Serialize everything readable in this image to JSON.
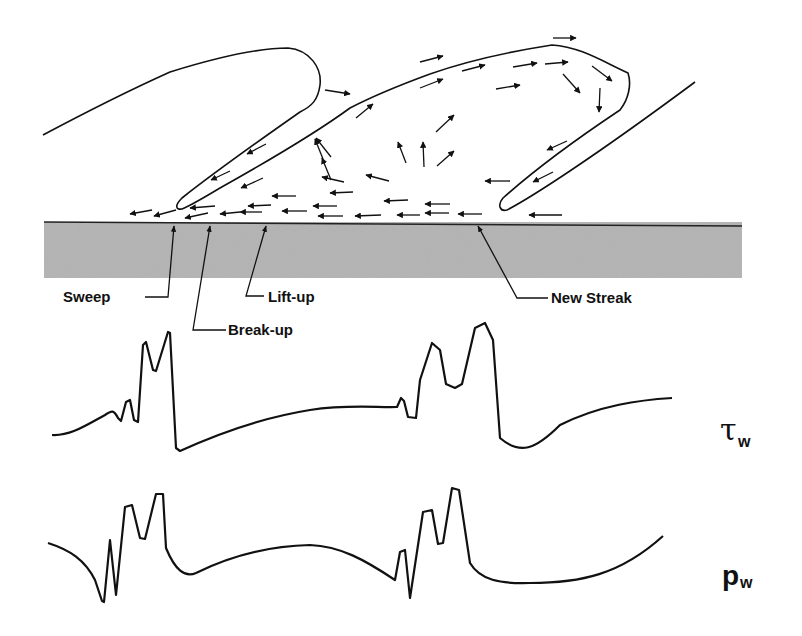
{
  "diagram": {
    "wall": {
      "fill_color": "#b3b3b3",
      "edge_color": "#222222"
    },
    "labels": {
      "sweep": "Sweep",
      "break_up": "Break-up",
      "lift_up": "Lift-up",
      "new_streak": "New Streak"
    },
    "signals": {
      "shear_stress": {
        "symbol": "τ",
        "subscript": "w"
      },
      "pressure": {
        "symbol": "p",
        "subscript": "w"
      }
    },
    "line_color": "#111111"
  }
}
